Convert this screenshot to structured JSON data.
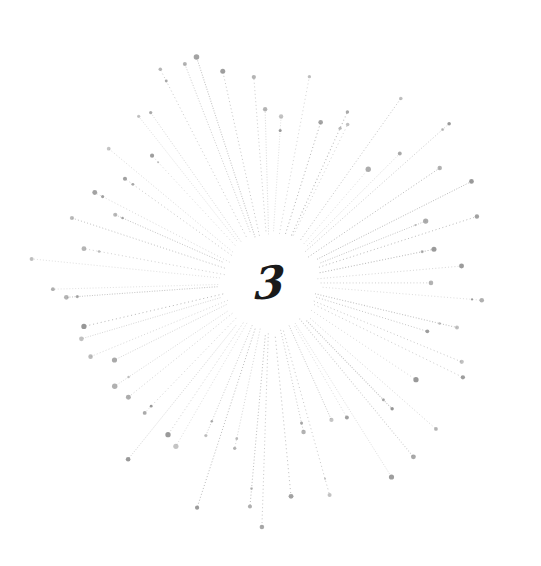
{
  "illustration": {
    "numeral": "3",
    "center": [
      270,
      283
    ],
    "inner_radius": 45,
    "ray_count": 64,
    "min_length": 150,
    "max_length": 245,
    "ray_color": "#9a9a9a",
    "dot_color": "#8c8c8c",
    "background": "#ffffff",
    "seed": 7
  }
}
